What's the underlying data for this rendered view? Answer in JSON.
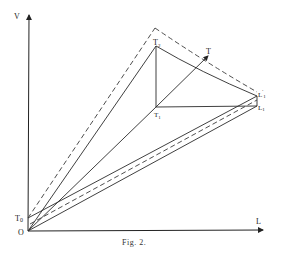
{
  "figure": {
    "caption": "Fig. 2.",
    "axes": {
      "vertical_label": "V",
      "horizontal_label": "L",
      "origin_label": "O"
    },
    "points": {
      "T0": "T",
      "T0_sub": "0",
      "T1": "T",
      "T1_sub": "1",
      "T2": "T",
      "T2_sub": "2",
      "T": "T",
      "L_prime": "L",
      "L_prime_sup": "'",
      "L_prime_sub": "1",
      "L1": "L",
      "L1_sub": "1"
    },
    "line_styles": {
      "solid": "#2a2a2a",
      "dashed": "#3a3a3a"
    }
  }
}
